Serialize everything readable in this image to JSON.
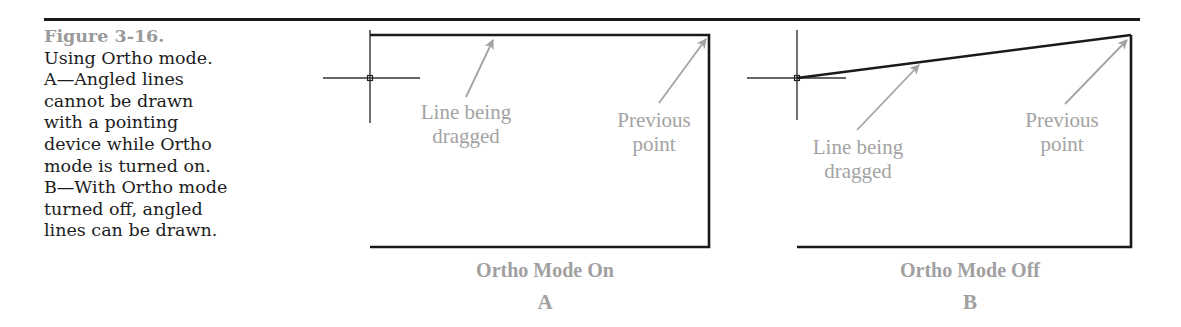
{
  "figure": {
    "number": "Figure 3-16.",
    "caption_lines": [
      "Using Ortho mode.",
      "A—Angled lines",
      "cannot be drawn",
      "with a pointing",
      "device while Ortho",
      "mode is turned on.",
      "B—With Ortho mode",
      "turned off, angled",
      "lines can be drawn."
    ]
  },
  "panels": [
    {
      "id": "A",
      "title": "Ortho Mode On",
      "letter": "A",
      "callouts": {
        "dragged": [
          "Line being",
          "dragged"
        ],
        "previous": [
          "Previous",
          "point"
        ]
      }
    },
    {
      "id": "B",
      "title": "Ortho Mode Off",
      "letter": "B",
      "callouts": {
        "dragged": [
          "Line being",
          "dragged"
        ],
        "previous": [
          "Previous",
          "point"
        ]
      }
    }
  ],
  "colors": {
    "line": "#1a1a1a",
    "callout": "#a3a3a3",
    "figure_number": "#9a9a9a"
  }
}
